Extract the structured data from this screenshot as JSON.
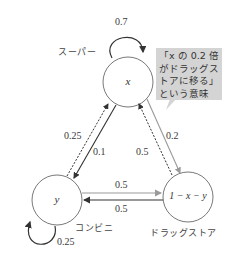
{
  "diagram": {
    "type": "markov-transition-diagram",
    "nodes": [
      {
        "id": "x",
        "label": "x",
        "store_label": "スーパー"
      },
      {
        "id": "y",
        "label": "y",
        "store_label": "コンビニ"
      },
      {
        "id": "z",
        "label": "1 − x − y",
        "store_label": "ドラッグストア"
      }
    ],
    "edges": [
      {
        "from": "x",
        "to": "x",
        "weight": "0.7",
        "style": "solid-dark"
      },
      {
        "from": "y",
        "to": "y",
        "weight": "0.25",
        "style": "solid-dark"
      },
      {
        "from": "x",
        "to": "y",
        "weight": "0.1",
        "style": "solid-dark"
      },
      {
        "from": "y",
        "to": "x",
        "weight": "0.25",
        "style": "dotted"
      },
      {
        "from": "x",
        "to": "z",
        "weight": "0.2",
        "style": "solid-gray"
      },
      {
        "from": "z",
        "to": "x",
        "weight": "0.5",
        "style": "dotted"
      },
      {
        "from": "y",
        "to": "z",
        "weight": "0.5",
        "style": "solid-gray"
      },
      {
        "from": "z",
        "to": "y",
        "weight": "0.5",
        "style": "solid-dark"
      }
    ],
    "callout": {
      "lines": [
        "「x の 0.2 倍",
        "がドラッグス",
        "トアに移る」",
        "という意味"
      ]
    },
    "colors": {
      "dark": "#333333",
      "gray": "#9a9a9a",
      "callout_bg": "#d4d4d4"
    }
  }
}
